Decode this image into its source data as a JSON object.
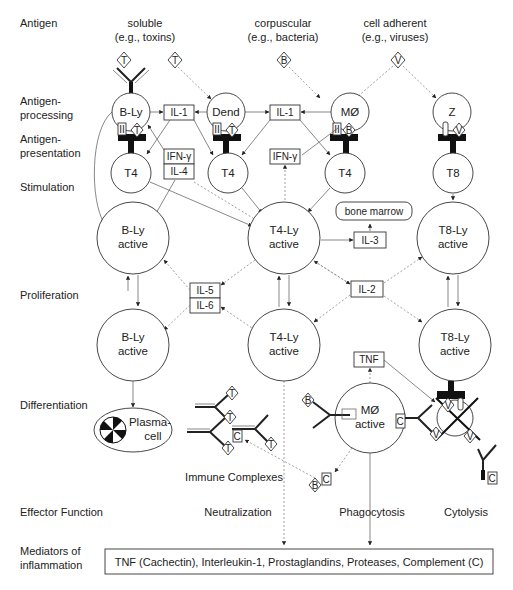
{
  "row_labels": {
    "antigen": "Antigen",
    "processing_1": "Antigen-",
    "processing_2": "processing",
    "presentation_1": "Antigen-",
    "presentation_2": "presentation",
    "stimulation": "Stimulation",
    "proliferation": "Proliferation",
    "differentiation": "Differentiation",
    "effector": "Effector Function",
    "mediators_1": "Mediators of",
    "mediators_2": "inflammation"
  },
  "antigen_types": {
    "soluble": "soluble",
    "soluble_ex": "(e.g., toxins)",
    "corpuscular": "corpuscular",
    "corpuscular_ex": "(e.g., bacteria)",
    "adherent": "cell adherent",
    "adherent_ex": "(e.g., viruses)"
  },
  "antigens": {
    "toxin": "T",
    "bacteria": "B",
    "virus": "V",
    "complement": "C"
  },
  "mhc": {
    "class2": "II",
    "class1": "I"
  },
  "cells": {
    "bly": "B-Ly",
    "dend": "Dend",
    "mo": "MØ",
    "z": "Z",
    "t4": "T4",
    "t8": "T8",
    "bly_active_1": "B-Ly",
    "bly_active_2": "active",
    "t4ly_active_1": "T4-Ly",
    "t4ly_active_2": "active",
    "t8ly_active_1": "T8-Ly",
    "t8ly_active_2": "active",
    "plasma_1": "Plasma-",
    "plasma_2": "cell",
    "mo_active_1": "MØ",
    "mo_active_2": "active"
  },
  "cytokines": {
    "il1_left": "IL-1",
    "il1_right": "IL-1",
    "ifn_left": "IFN-γ",
    "il4": "IL-4",
    "ifn_center": "IFN-γ",
    "il3": "IL-3",
    "bone_marrow": "bone marrow",
    "il5": "IL-5",
    "il6": "IL-6",
    "il2": "IL-2",
    "tnf": "TNF"
  },
  "effectors": {
    "immune_complexes": "Immune Complexes",
    "neutralization": "Neutralization",
    "phagocytosis": "Phagocytosis",
    "cytolysis": "Cytolysis"
  },
  "mediators_box": "TNF (Cachectin), Interleukin-1, Prostaglandins, Proteases, Complement (C)"
}
